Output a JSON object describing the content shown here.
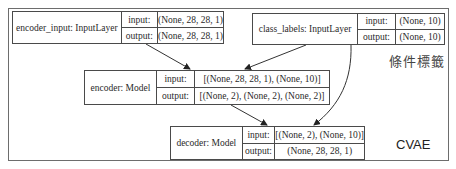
{
  "diagram": {
    "title": "CVAE",
    "annotation": "條件標籤",
    "nodes": [
      {
        "id": "encoder_input",
        "label": "encoder_input: InputLayer",
        "input_key": "input:",
        "input_value": "(None, 28, 28, 1)",
        "output_key": "output:",
        "output_value": "(None, 28, 28, 1)"
      },
      {
        "id": "class_labels",
        "label": "class_labels: InputLayer",
        "input_key": "input:",
        "input_value": "(None, 10)",
        "output_key": "output:",
        "output_value": "(None, 10)"
      },
      {
        "id": "encoder",
        "label": "encoder: Model",
        "input_key": "input:",
        "input_value": "[(None, 28, 28, 1), (None, 10)]",
        "output_key": "output:",
        "output_value": "[(None, 2), (None, 2), (None, 2)]"
      },
      {
        "id": "decoder",
        "label": "decoder: Model",
        "input_key": "input:",
        "input_value": "[(None, 2), (None, 10)]",
        "output_key": "output:",
        "output_value": "(None, 28, 28, 1)"
      }
    ],
    "edges": [
      {
        "from": "encoder_input",
        "to": "encoder"
      },
      {
        "from": "class_labels",
        "to": "encoder"
      },
      {
        "from": "encoder",
        "to": "decoder"
      },
      {
        "from": "class_labels",
        "to": "decoder"
      }
    ]
  }
}
